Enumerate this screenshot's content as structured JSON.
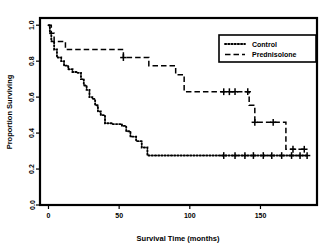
{
  "chart_data": {
    "type": "line",
    "subtype": "kaplan-meier-survival",
    "title": "",
    "xlabel": "Survival Time (months)",
    "ylabel": "Proportion Surviving",
    "xlim": [
      -6,
      190
    ],
    "ylim": [
      0.0,
      1.04
    ],
    "xticks": [
      0,
      50,
      100,
      150
    ],
    "xticklabels": [
      "0",
      "50",
      "100",
      "150"
    ],
    "yticks": [
      0.0,
      0.2,
      0.4,
      0.6,
      0.8,
      1.0
    ],
    "yticklabels": [
      "0.0",
      "0.2",
      "0.4",
      "0.6",
      "0.8",
      "1.0"
    ],
    "grid": false,
    "legend_position": "top-right",
    "box_frame": true,
    "series": [
      {
        "name": "Control",
        "linestyle": "dotted",
        "color": "#000000",
        "steps": [
          [
            0,
            1.0
          ],
          [
            1,
            1.0
          ],
          [
            1,
            0.955
          ],
          [
            2,
            0.955
          ],
          [
            2,
            0.91
          ],
          [
            4,
            0.91
          ],
          [
            4,
            0.865
          ],
          [
            6,
            0.865
          ],
          [
            6,
            0.82
          ],
          [
            9,
            0.82
          ],
          [
            9,
            0.8
          ],
          [
            11,
            0.8
          ],
          [
            11,
            0.775
          ],
          [
            14,
            0.775
          ],
          [
            14,
            0.755
          ],
          [
            17,
            0.755
          ],
          [
            17,
            0.74
          ],
          [
            20,
            0.74
          ],
          [
            20,
            0.735
          ],
          [
            23,
            0.735
          ],
          [
            23,
            0.7
          ],
          [
            25,
            0.7
          ],
          [
            25,
            0.665
          ],
          [
            27,
            0.665
          ],
          [
            27,
            0.64
          ],
          [
            29,
            0.64
          ],
          [
            29,
            0.6
          ],
          [
            31,
            0.6
          ],
          [
            31,
            0.59
          ],
          [
            33,
            0.59
          ],
          [
            33,
            0.555
          ],
          [
            35,
            0.555
          ],
          [
            35,
            0.52
          ],
          [
            37,
            0.52
          ],
          [
            37,
            0.5
          ],
          [
            40,
            0.5
          ],
          [
            40,
            0.455
          ],
          [
            45,
            0.455
          ],
          [
            45,
            0.45
          ],
          [
            52,
            0.45
          ],
          [
            52,
            0.44
          ],
          [
            55,
            0.44
          ],
          [
            55,
            0.41
          ],
          [
            58,
            0.41
          ],
          [
            58,
            0.38
          ],
          [
            62,
            0.38
          ],
          [
            62,
            0.355
          ],
          [
            66,
            0.355
          ],
          [
            66,
            0.32
          ],
          [
            70,
            0.32
          ],
          [
            70,
            0.275
          ],
          [
            183,
            0.275
          ]
        ],
        "censored": [
          [
            124,
            0.275
          ],
          [
            132,
            0.275
          ],
          [
            139,
            0.275
          ],
          [
            145,
            0.275
          ],
          [
            152,
            0.275
          ],
          [
            158,
            0.275
          ],
          [
            165,
            0.275
          ],
          [
            172,
            0.275
          ],
          [
            178,
            0.275
          ],
          [
            183,
            0.275
          ]
        ]
      },
      {
        "name": "Prednisolone",
        "linestyle": "dashed",
        "color": "#000000",
        "steps": [
          [
            0,
            1.0
          ],
          [
            2,
            1.0
          ],
          [
            2,
            0.955
          ],
          [
            4,
            0.955
          ],
          [
            4,
            0.91
          ],
          [
            12,
            0.91
          ],
          [
            12,
            0.865
          ],
          [
            53,
            0.865
          ],
          [
            53,
            0.82
          ],
          [
            71,
            0.82
          ],
          [
            71,
            0.775
          ],
          [
            90,
            0.775
          ],
          [
            90,
            0.725
          ],
          [
            96,
            0.725
          ],
          [
            96,
            0.63
          ],
          [
            142,
            0.63
          ],
          [
            142,
            0.555
          ],
          [
            146,
            0.555
          ],
          [
            146,
            0.46
          ],
          [
            168,
            0.46
          ],
          [
            168,
            0.31
          ],
          [
            183,
            0.31
          ]
        ],
        "censored": [
          [
            53,
            0.82
          ],
          [
            124,
            0.63
          ],
          [
            128,
            0.63
          ],
          [
            132,
            0.63
          ],
          [
            141,
            0.63
          ],
          [
            146,
            0.46
          ],
          [
            159,
            0.46
          ],
          [
            173,
            0.31
          ],
          [
            181,
            0.31
          ]
        ]
      }
    ]
  },
  "legend": {
    "entries": [
      {
        "label": "Control",
        "style": "dotted"
      },
      {
        "label": "Prednisolone",
        "style": "dashed"
      }
    ]
  },
  "axes": {
    "x_label": "Survival Time (months)",
    "y_label": "Proportion Surviving"
  }
}
